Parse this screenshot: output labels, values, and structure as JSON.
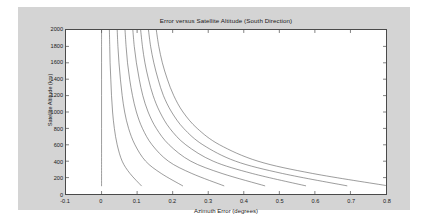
{
  "chart_data": {
    "type": "line",
    "title": "Error versus Satellite Altitude (South Direction)",
    "xlabel": "Azimuth Error (degrees)",
    "ylabel": "Satellite Altitude (km)",
    "xlim": [
      -0.1,
      0.8
    ],
    "ylim": [
      0,
      2000
    ],
    "grid": false,
    "legend": null,
    "xticks": [
      -0.1,
      0,
      0.1,
      0.2,
      0.3,
      0.4,
      0.5,
      0.6,
      0.7,
      0.8
    ],
    "xtick_labels": [
      "-0.1",
      "0",
      "0.1",
      "0.2",
      "0.3",
      "0.4",
      "0.5",
      "0.6",
      "0.7",
      "0.8"
    ],
    "yticks": [
      0,
      200,
      400,
      600,
      800,
      1000,
      1200,
      1400,
      1600,
      1800,
      2000
    ],
    "ytick_labels": [
      "0",
      "200",
      "400",
      "600",
      "800",
      "1000",
      "1200",
      "1400",
      "1600",
      "1800",
      "2000"
    ],
    "line_color": "#5a5a5a",
    "line_width": 0.6,
    "series": [
      {
        "name": "curve-1",
        "comment": "vertical reference line at zero azimuth error",
        "x": [
          0.0,
          0.0,
          0.0,
          0.0,
          0.0,
          0.0,
          0.0,
          0.0,
          0.0,
          0.0,
          0.0
        ],
        "y": [
          2000,
          1800,
          1600,
          1400,
          1200,
          1000,
          800,
          600,
          400,
          250,
          100
        ]
      },
      {
        "name": "curve-2",
        "x": [
          0.022,
          0.023,
          0.024,
          0.026,
          0.028,
          0.031,
          0.036,
          0.044,
          0.058,
          0.08,
          0.112
        ],
        "y": [
          2000,
          1800,
          1600,
          1400,
          1200,
          1000,
          800,
          600,
          400,
          250,
          100
        ]
      },
      {
        "name": "curve-3",
        "x": [
          0.044,
          0.046,
          0.049,
          0.053,
          0.058,
          0.065,
          0.076,
          0.094,
          0.124,
          0.168,
          0.228
        ],
        "y": [
          2000,
          1800,
          1600,
          1400,
          1200,
          1000,
          800,
          600,
          400,
          250,
          100
        ]
      },
      {
        "name": "curve-4",
        "x": [
          0.066,
          0.069,
          0.073,
          0.079,
          0.087,
          0.098,
          0.115,
          0.142,
          0.188,
          0.254,
          0.344
        ],
        "y": [
          2000,
          1800,
          1600,
          1400,
          1200,
          1000,
          800,
          600,
          400,
          250,
          100
        ]
      },
      {
        "name": "curve-5",
        "x": [
          0.088,
          0.092,
          0.098,
          0.106,
          0.116,
          0.131,
          0.154,
          0.19,
          0.251,
          0.339,
          0.459
        ],
        "y": [
          2000,
          1800,
          1600,
          1400,
          1200,
          1000,
          800,
          600,
          400,
          250,
          100
        ]
      },
      {
        "name": "curve-6",
        "x": [
          0.11,
          0.115,
          0.122,
          0.132,
          0.145,
          0.164,
          0.192,
          0.237,
          0.314,
          0.424,
          0.574
        ],
        "y": [
          2000,
          1800,
          1600,
          1400,
          1200,
          1000,
          800,
          600,
          400,
          250,
          100
        ]
      },
      {
        "name": "curve-7",
        "x": [
          0.132,
          0.138,
          0.147,
          0.159,
          0.174,
          0.197,
          0.231,
          0.285,
          0.377,
          0.509,
          0.69
        ],
        "y": [
          2000,
          1800,
          1600,
          1400,
          1200,
          1000,
          800,
          600,
          400,
          250,
          100
        ]
      },
      {
        "name": "curve-8",
        "x": [
          0.154,
          0.161,
          0.171,
          0.185,
          0.203,
          0.229,
          0.269,
          0.332,
          0.44,
          0.594,
          0.805
        ],
        "y": [
          2000,
          1800,
          1600,
          1400,
          1200,
          1000,
          800,
          600,
          400,
          250,
          100
        ]
      }
    ]
  },
  "figure": {
    "background_color": "#d4d4d4",
    "axes_background_color": "#ffffff",
    "axes_border_color": "#4a4a4a"
  }
}
